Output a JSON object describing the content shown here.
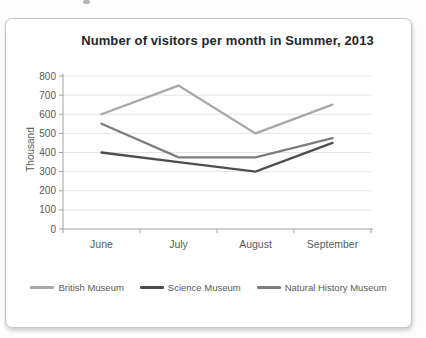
{
  "chart_data": {
    "type": "line",
    "title": "Number of visitors per month in Summer, 2013",
    "xlabel": "",
    "ylabel": "Thousand",
    "categories": [
      "June",
      "July",
      "August",
      "September"
    ],
    "series": [
      {
        "name": "British Museum",
        "color": "#a8a8a8",
        "values": [
          600,
          750,
          500,
          650
        ]
      },
      {
        "name": "Science Museum",
        "color": "#4d4d4d",
        "values": [
          400,
          350,
          300,
          450
        ]
      },
      {
        "name": "Natural History Museum",
        "color": "#7d7d7d",
        "values": [
          550,
          375,
          375,
          475
        ]
      }
    ],
    "ylim": [
      0,
      800
    ],
    "ytick_step": 100,
    "grid": true,
    "legend_position": "bottom",
    "colors": {
      "title_text": "#262626",
      "axis_line": "#a0a0a0",
      "tick_text": "#595959",
      "gridline": "#e4e4e4",
      "frame_border": "#c6c6c6",
      "background": "#ffffff"
    }
  }
}
